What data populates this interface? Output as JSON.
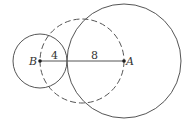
{
  "diagram": {
    "points": [
      {
        "name": "B",
        "x": 40,
        "y": 61
      },
      {
        "name": "A",
        "x": 124,
        "y": 61
      }
    ],
    "segment_labels": [
      {
        "text": "4",
        "x": 54,
        "y": 61
      },
      {
        "text": "8",
        "x": 95,
        "y": 61
      }
    ],
    "circles": [
      {
        "id": "small",
        "center": "B",
        "radius_label": "4",
        "style": "solid"
      },
      {
        "id": "large",
        "center": "A",
        "radius_label": "8",
        "style": "solid"
      },
      {
        "id": "dashed",
        "center": "midpoint of BA",
        "style": "dashed"
      }
    ],
    "colors": {
      "stroke": "#555555",
      "point": "#222222"
    }
  }
}
